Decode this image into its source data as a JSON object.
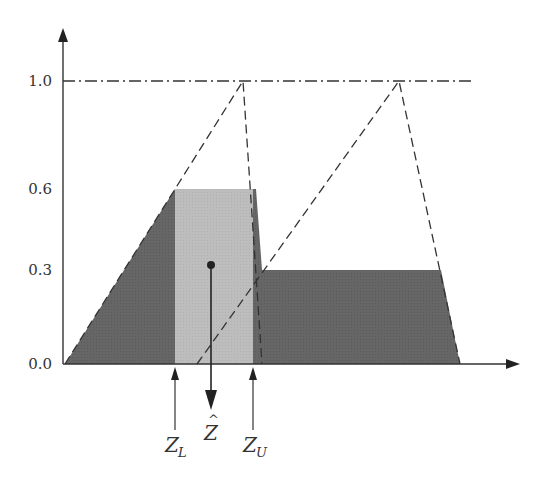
{
  "diagram": {
    "title": "",
    "y_axis": {
      "ticks": [
        {
          "value": 0.0,
          "label": "0.0"
        },
        {
          "value": 0.3,
          "label": "0.3"
        },
        {
          "value": 0.6,
          "label": "0.6"
        },
        {
          "value": 1.0,
          "label": "1.0"
        }
      ]
    },
    "fuzzy_sets": [
      {
        "name": "triangle-1",
        "style": "dashed",
        "peak": 1.0,
        "cut_level": 0.6
      },
      {
        "name": "triangle-2",
        "style": "dashed",
        "peak": 1.0,
        "cut_level": 0.3
      }
    ],
    "reference_line": {
      "level": 1.0,
      "style": "dash-dot"
    },
    "markers": {
      "z_lower": {
        "main": "Z",
        "sub": "L"
      },
      "z_hat": {
        "main": "Z",
        "accent": "^"
      },
      "z_upper": {
        "main": "Z",
        "sub": "U"
      }
    },
    "colors": {
      "dark_fill": "#666666",
      "light_fill": "#bdbdbd",
      "line": "#333333",
      "background": "#ffffff"
    }
  }
}
